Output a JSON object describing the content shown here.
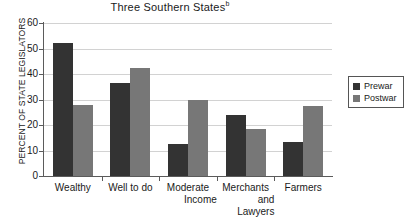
{
  "chart_data": {
    "type": "bar",
    "title": "Three Southern States",
    "title_superscript": "b",
    "xlabel": "",
    "ylabel": "PERCENT OF STATE LEGISLATORS",
    "ylim": [
      0,
      60
    ],
    "yticks": [
      0,
      10,
      20,
      30,
      40,
      50,
      60
    ],
    "ytick_labels": [
      "0",
      "10",
      "20",
      "30",
      "40",
      "50",
      "60"
    ],
    "grid": true,
    "legend_position": "right",
    "categories": [
      "Wealthy",
      "Well to do",
      "Moderate Income",
      "Merchants and Lawyers",
      "Farmers"
    ],
    "category_lines": [
      [
        "Wealthy"
      ],
      [
        "Well to do"
      ],
      [
        "Moderate",
        "Income"
      ],
      [
        "Merchants",
        "and",
        "Lawyers"
      ],
      [
        "Farmers"
      ]
    ],
    "series": [
      {
        "name": "Prewar",
        "color": "#333333",
        "values": [
          52,
          36.5,
          12.5,
          24,
          13.5
        ]
      },
      {
        "name": "Postwar",
        "color": "#777777",
        "values": [
          28,
          42.5,
          30,
          18.5,
          27.5
        ]
      }
    ]
  },
  "legend": {
    "items": [
      {
        "label": "Prewar",
        "color": "#333333"
      },
      {
        "label": "Postwar",
        "color": "#777777"
      }
    ]
  },
  "colors": {
    "prewar": "#333333",
    "postwar": "#777777",
    "axis": "#5b5b5b",
    "grid": "#d2d2d2",
    "background": "#ffffff"
  }
}
